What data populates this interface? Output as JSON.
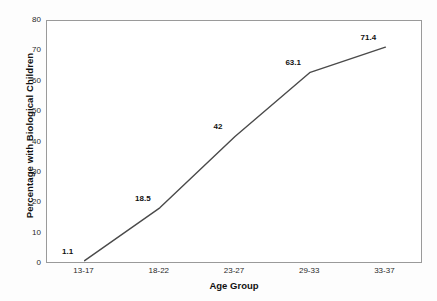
{
  "chart_data": {
    "type": "line",
    "title": "",
    "xlabel": "Age Group",
    "ylabel": "Percentage with Biological Children",
    "categories": [
      "13-17",
      "18-22",
      "23-27",
      "29-33",
      "33-37"
    ],
    "values": [
      1.1,
      18.5,
      42,
      63.1,
      71.4
    ],
    "point_labels": [
      "1.1",
      "18.5",
      "42",
      "63.1",
      "71.4"
    ],
    "ylim": [
      0,
      80
    ],
    "ytick_labels": [
      "80",
      "70",
      "60",
      "50",
      "40",
      "30",
      "20",
      "10",
      "0"
    ],
    "ytick_values": [
      80,
      70,
      60,
      50,
      40,
      30,
      20,
      10,
      0
    ],
    "grid": false,
    "legend": false,
    "series_color": "#4a4a4a",
    "border_color": "#9a9a9a",
    "plot_background": "#ffffff"
  }
}
